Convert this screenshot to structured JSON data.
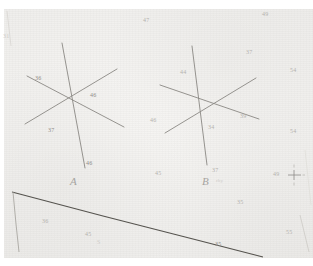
{
  "document": {
    "kind": "scanned-survey-photo",
    "header_strip_text": "",
    "stations": [
      {
        "id": "A",
        "label": "A",
        "x": 70,
        "y": 175
      },
      {
        "id": "B",
        "label": "B",
        "x": 202,
        "y": 175
      }
    ],
    "annotation_near_b": "rhy"
  },
  "elevation_labels": [
    {
      "text": "31",
      "x": 3,
      "y": 33,
      "tone": "vfaint"
    },
    {
      "text": "47",
      "x": 143,
      "y": 17,
      "tone": "faint"
    },
    {
      "text": "49",
      "x": 262,
      "y": 11,
      "tone": "faint"
    },
    {
      "text": "37",
      "x": 246,
      "y": 49,
      "tone": "faint"
    },
    {
      "text": "54",
      "x": 290,
      "y": 67,
      "tone": "faint"
    },
    {
      "text": "36",
      "x": 35,
      "y": 75,
      "tone": "normal"
    },
    {
      "text": "44",
      "x": 180,
      "y": 69,
      "tone": "faint"
    },
    {
      "text": "46",
      "x": 90,
      "y": 92,
      "tone": "normal"
    },
    {
      "text": "39",
      "x": 240,
      "y": 113,
      "tone": "faint"
    },
    {
      "text": "46",
      "x": 150,
      "y": 117,
      "tone": "faint"
    },
    {
      "text": "34",
      "x": 208,
      "y": 124,
      "tone": "faint"
    },
    {
      "text": "37",
      "x": 48,
      "y": 127,
      "tone": "normal"
    },
    {
      "text": "54",
      "x": 290,
      "y": 128,
      "tone": "faint"
    },
    {
      "text": "46",
      "x": 86,
      "y": 160,
      "tone": "normal"
    },
    {
      "text": "45",
      "x": 155,
      "y": 170,
      "tone": "faint"
    },
    {
      "text": "37",
      "x": 212,
      "y": 167,
      "tone": "faint"
    },
    {
      "text": "49",
      "x": 273,
      "y": 171,
      "tone": "faint"
    },
    {
      "text": "35",
      "x": 237,
      "y": 199,
      "tone": "faint"
    },
    {
      "text": "36",
      "x": 42,
      "y": 218,
      "tone": "faint"
    },
    {
      "text": "45",
      "x": 85,
      "y": 231,
      "tone": "faint"
    },
    {
      "text": "S",
      "x": 97,
      "y": 239,
      "tone": "vfaint"
    },
    {
      "text": "55",
      "x": 286,
      "y": 229,
      "tone": "faint"
    },
    {
      "text": "35",
      "x": 215,
      "y": 241,
      "tone": "normal"
    }
  ],
  "figure_a": {
    "name": "radial-star-a",
    "center": {
      "x": 71,
      "y": 98
    },
    "rays": [
      {
        "name": "ray-a-steep",
        "x1": 62,
        "y1": 43,
        "x2": 85,
        "y2": 168
      },
      {
        "name": "ray-a-ne-sw",
        "x1": 25,
        "y1": 124,
        "x2": 117,
        "y2": 69
      },
      {
        "name": "ray-a-nw-se",
        "x1": 27,
        "y1": 76,
        "x2": 124,
        "y2": 127
      }
    ]
  },
  "figure_b": {
    "name": "radial-star-b",
    "center": {
      "x": 203,
      "y": 108
    },
    "rays": [
      {
        "name": "ray-b-steep",
        "x1": 192,
        "y1": 46,
        "x2": 207,
        "y2": 165
      },
      {
        "name": "ray-b-ne-sw",
        "x1": 165,
        "y1": 133,
        "x2": 256,
        "y2": 78
      },
      {
        "name": "ray-b-nw-se",
        "x1": 160,
        "y1": 85,
        "x2": 259,
        "y2": 119
      }
    ]
  },
  "boundary": {
    "name": "diagonal-boundary-line",
    "points": "12,192 103,216 193,239 263,257",
    "left_edge_points": "13,192 16,224 19,252"
  },
  "grid_tick": {
    "name": "survey-grid-tick",
    "label": "49",
    "x": 285,
    "y": 172
  },
  "colors": {
    "paper": "#f1f0ed",
    "line_ink": "#6f6d68",
    "boundary_ink": "#4a4844",
    "label_ink": "#8e8c88"
  }
}
